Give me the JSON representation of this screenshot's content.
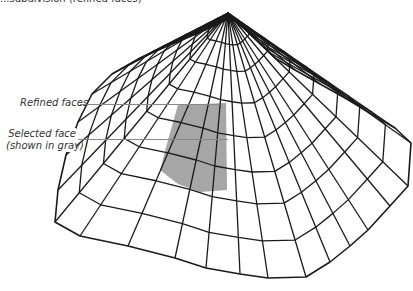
{
  "caption": "...subdivision (refined faces)",
  "labels": {
    "refined": "Refined faces",
    "selected_line1": "Selected face",
    "selected_line2": "(shown in gray)"
  },
  "colors": {
    "line": "#1a1a1a",
    "selected_fill": "#a6a6a6",
    "leader": "#8c8c8c"
  },
  "mesh": {
    "apex": [
      228,
      13
    ],
    "rings": [
      0.12,
      0.22,
      0.34,
      0.47,
      0.6,
      0.72,
      0.86,
      1.0
    ],
    "boundary": [
      [
        55,
        222
      ],
      [
        80,
        236
      ],
      [
        128,
        246
      ],
      [
        175,
        258
      ],
      [
        206,
        268
      ],
      [
        240,
        274
      ],
      [
        268,
        278
      ],
      [
        306,
        277
      ],
      [
        330,
        262
      ],
      [
        350,
        246
      ],
      [
        368,
        230
      ],
      [
        390,
        206
      ],
      [
        408,
        186
      ],
      [
        411,
        143
      ],
      [
        395,
        128
      ],
      [
        370,
        113
      ],
      [
        345,
        98
      ],
      [
        320,
        84
      ],
      [
        295,
        70
      ],
      [
        275,
        58
      ],
      [
        262,
        45
      ],
      [
        252,
        35
      ],
      [
        242,
        27
      ],
      [
        234,
        20
      ],
      [
        226,
        20
      ],
      [
        214,
        26
      ],
      [
        196,
        34
      ],
      [
        170,
        45
      ],
      [
        140,
        58
      ],
      [
        112,
        74
      ],
      [
        92,
        94
      ],
      [
        78,
        122
      ],
      [
        66,
        155
      ],
      [
        58,
        190
      ]
    ],
    "selected_poly": [
      [
        178,
        105
      ],
      [
        226,
        103
      ],
      [
        227,
        190
      ],
      [
        200,
        192
      ],
      [
        178,
        184
      ],
      [
        160,
        170
      ],
      [
        168,
        140
      ]
    ]
  }
}
